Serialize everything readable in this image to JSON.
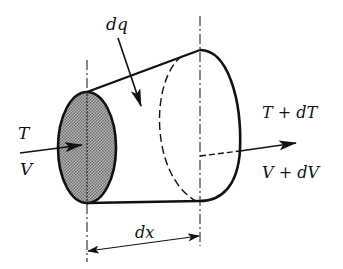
{
  "diagram": {
    "labels": {
      "heat": "dq",
      "left_top": "T",
      "left_bottom": "V",
      "right_top": "T + dT",
      "right_bottom": "V + dV",
      "length": "dx"
    },
    "colors": {
      "stroke": "#111111",
      "shade": "#9a9a9a",
      "background": "#ffffff"
    }
  }
}
